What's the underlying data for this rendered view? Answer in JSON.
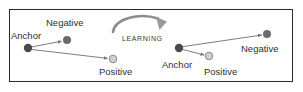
{
  "figure": {
    "background_color": "#ffffff",
    "border_color": "#2b2b2b"
  },
  "colors": {
    "anchor_dot": "#4a4a4a",
    "negative_dot": "#6b6b6b",
    "positive_dot": "#cfcfcf",
    "positive_dot_outline": "#8a8a8a",
    "edge": "#6e6e6e",
    "text": "#2f2f2f",
    "arrow": "#8c8c8c"
  },
  "process_arrow": {
    "label": "LEARNING",
    "direction": "clockwise",
    "x": 122,
    "y": 35
  },
  "clusters": [
    {
      "name": "before-learning",
      "side": "left",
      "points": [
        {
          "id": "anchor",
          "label": "Anchor",
          "type": "anchor",
          "cx": 28,
          "cy": 48,
          "r": 4.2,
          "label_x": 11,
          "label_y": 31
        },
        {
          "id": "negative",
          "label": "Negative",
          "type": "negative",
          "cx": 67,
          "cy": 40,
          "r": 4.0,
          "label_x": 46,
          "label_y": 18
        },
        {
          "id": "positive",
          "label": "Positive",
          "type": "positive",
          "cx": 113,
          "cy": 59,
          "r": 3.8,
          "label_x": 99,
          "label_y": 67
        }
      ],
      "edges": [
        {
          "from": "anchor",
          "to": "negative",
          "arrow": true
        },
        {
          "from": "anchor",
          "to": "positive",
          "arrow": true
        }
      ]
    },
    {
      "name": "after-learning",
      "side": "right",
      "points": [
        {
          "id": "anchor",
          "label": "Anchor",
          "type": "anchor",
          "cx": 179,
          "cy": 48,
          "r": 4.2,
          "label_x": 162,
          "label_y": 60
        },
        {
          "id": "positive",
          "label": "Positive",
          "type": "positive",
          "cx": 209,
          "cy": 56,
          "r": 3.8,
          "label_x": 204,
          "label_y": 67
        },
        {
          "id": "negative",
          "label": "Negative",
          "type": "negative",
          "cx": 267,
          "cy": 34,
          "r": 4.0,
          "label_x": 241,
          "label_y": 44
        }
      ],
      "edges": [
        {
          "from": "anchor",
          "to": "positive",
          "arrow": true
        },
        {
          "from": "anchor",
          "to": "negative",
          "arrow": true
        }
      ]
    }
  ],
  "labels": {
    "left_anchor": "Anchor",
    "left_negative": "Negative",
    "left_positive": "Positive",
    "right_anchor": "Anchor",
    "right_positive": "Positive",
    "right_negative": "Negative",
    "learning": "LEARNING"
  }
}
